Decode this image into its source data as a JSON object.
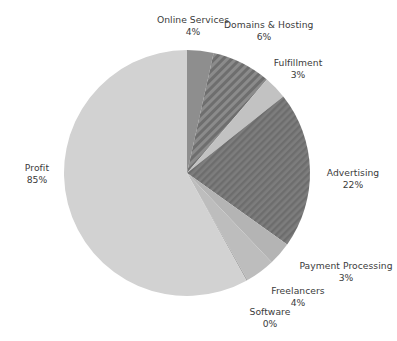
{
  "chart_data": {
    "type": "pie",
    "title": "",
    "subtitle": "",
    "xlabel": "",
    "ylabel": "",
    "legend_position": "labels-outside",
    "grid": false,
    "start_angle_deg": 0,
    "direction": "clockwise",
    "center": {
      "x": 187,
      "y": 173
    },
    "radius": 123,
    "categories": [
      "Online Services",
      "Domains & Hosting",
      "Fulfillment",
      "Advertising",
      "Payment Processing",
      "Freelancers",
      "Software",
      "Profit"
    ],
    "values": [
      4,
      6,
      3,
      22,
      3,
      4,
      0,
      85
    ],
    "value_labels": [
      "4%",
      "6%",
      "3%",
      "22%",
      "3%",
      "4%",
      "0%",
      "85%"
    ],
    "slices": [
      {
        "name": "Online Services",
        "value": 4,
        "value_label": "4%",
        "sweep_deg": 12.5,
        "start_deg": 0,
        "end_deg": 12.5,
        "fill": "#8e8e8e",
        "pattern": "solid",
        "label_name": "Online Services",
        "label_pct": "4%"
      },
      {
        "name": "Domains & Hosting",
        "value": 6,
        "value_label": "6%",
        "sweep_deg": 28.0,
        "start_deg": 12.5,
        "end_deg": 40.5,
        "fill": "#7d7d7d",
        "pattern": "diagonal-stripes",
        "label_name": "Domains & Hosting",
        "label_pct": "6%"
      },
      {
        "name": "Fulfillment",
        "value": 3,
        "value_label": "3%",
        "sweep_deg": 11.0,
        "start_deg": 40.5,
        "end_deg": 51.5,
        "fill": "#c2c2c2",
        "pattern": "solid",
        "label_name": "Fulfillment",
        "label_pct": "3%"
      },
      {
        "name": "Advertising",
        "value": 22,
        "value_label": "22%",
        "sweep_deg": 74.0,
        "start_deg": 51.5,
        "end_deg": 125.5,
        "fill": "#767676",
        "pattern": "diagonal-stripes-fine",
        "label_name": "Advertising",
        "label_pct": "22%"
      },
      {
        "name": "Payment Processing",
        "value": 3,
        "value_label": "3%",
        "sweep_deg": 11.0,
        "start_deg": 125.5,
        "end_deg": 136.5,
        "fill": "#b4b4b4",
        "pattern": "solid",
        "label_name": "Payment Processing",
        "label_pct": "3%"
      },
      {
        "name": "Freelancers",
        "value": 4,
        "value_label": "4%",
        "sweep_deg": 14.0,
        "start_deg": 136.5,
        "end_deg": 150.5,
        "fill": "#bdbdbd",
        "pattern": "solid",
        "label_name": "Freelancers",
        "label_pct": "4%"
      },
      {
        "name": "Software",
        "value": 0,
        "value_label": "0%",
        "sweep_deg": 0.6,
        "start_deg": 150.5,
        "end_deg": 151.1,
        "fill": "#a8a8a8",
        "pattern": "solid",
        "label_name": "Software",
        "label_pct": "0%"
      },
      {
        "name": "Profit",
        "value": 85,
        "value_label": "85%",
        "sweep_deg": 208.9,
        "start_deg": 151.1,
        "end_deg": 360,
        "fill": "#d2d2d2",
        "pattern": "solid",
        "label_name": "Profit",
        "label_pct": "85%"
      }
    ],
    "colors": {
      "background": "#ffffff",
      "text": "#3b3b3b",
      "online_services": "#8e8e8e",
      "domains_hosting": "#7d7d7d",
      "fulfillment": "#c2c2c2",
      "advertising": "#767676",
      "payment_processing": "#b4b4b4",
      "freelancers": "#bdbdbd",
      "software": "#a8a8a8",
      "profit": "#d2d2d2"
    }
  }
}
